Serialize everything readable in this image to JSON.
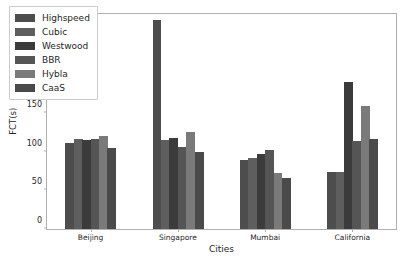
{
  "chart_data": {
    "type": "bar",
    "title": "",
    "xlabel": "Cities",
    "ylabel": "FCT(s)",
    "categories": [
      "Beijing",
      "Singapore",
      "Mumbai",
      "California"
    ],
    "series": [
      {
        "name": "Highspeed",
        "color": "#4d4d4d",
        "values": [
          111,
          270,
          89,
          74
        ]
      },
      {
        "name": "Cubic",
        "color": "#5e5e5e",
        "values": [
          117,
          115,
          92,
          74
        ]
      },
      {
        "name": "Westwood",
        "color": "#3b3b3b",
        "values": [
          115,
          118,
          97,
          190
        ]
      },
      {
        "name": "BBR",
        "color": "#555555",
        "values": [
          116,
          106,
          102,
          114
        ]
      },
      {
        "name": "Hybla",
        "color": "#7a7a7a",
        "values": [
          120,
          126,
          73,
          159
        ]
      },
      {
        "name": "CaaS",
        "color": "#4a4a4a",
        "values": [
          105,
          100,
          66,
          117
        ]
      }
    ],
    "ylim": [
      0,
      278
    ],
    "yticks": [
      0,
      50,
      100,
      150,
      200,
      250
    ],
    "ytick_labels": [
      "0",
      "50",
      "100",
      "150",
      "200",
      "250"
    ],
    "grid": false,
    "legend_position": "upper left"
  },
  "legend": {
    "entries": [
      {
        "label": "Highspeed"
      },
      {
        "label": "Cubic"
      },
      {
        "label": "Westwood"
      },
      {
        "label": "BBR"
      },
      {
        "label": "Hybla"
      },
      {
        "label": "CaaS"
      }
    ]
  },
  "axes": {
    "frame_color": "#b0b0b0",
    "tick_color": "#262626"
  }
}
